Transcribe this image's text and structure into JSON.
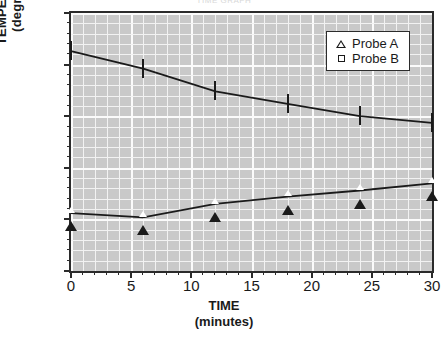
{
  "title_sliver": "TIME GRAPH",
  "axes": {
    "x": {
      "label_main": "TIME",
      "label_sub": "(minutes)",
      "ticks": [
        0,
        5,
        10,
        15,
        20,
        25,
        30
      ],
      "min": 0,
      "max": 30,
      "minor_step": 1
    },
    "y": {
      "label_main": "TEMPERATURE",
      "label_sub": "(degrees C)",
      "ticks": [
        20,
        30,
        40,
        50,
        60,
        70
      ],
      "min": 20,
      "max": 70,
      "minor_step": 2
    }
  },
  "legend": {
    "position": "top-right-inside",
    "entries": [
      {
        "label": "Probe A",
        "marker": "triangle-open"
      },
      {
        "label": "Probe B",
        "marker": "square-open"
      }
    ]
  },
  "colors": {
    "plot_background": "#c9c9c9",
    "gridline": "#f2f2f2",
    "axis": "#2b2b2b",
    "line": "#1a1a1a",
    "marker_fill": "#ffffff",
    "page_background": "#ffffff",
    "text": "#1a1a1a"
  },
  "chart_data": {
    "type": "line",
    "title": "",
    "xlabel": "TIME (minutes)",
    "ylabel": "TEMPERATURE (degrees C)",
    "xlim": [
      0,
      30
    ],
    "ylim": [
      20,
      70
    ],
    "grid": true,
    "legend_position": "upper right",
    "x": [
      0,
      6,
      12,
      18,
      24,
      30
    ],
    "series": [
      {
        "name": "Probe A",
        "marker": "triangle-open",
        "values": [
          31.2,
          30.4,
          33.0,
          34.4,
          35.6,
          37.0
        ]
      },
      {
        "name": "Probe B",
        "marker": "square-open",
        "values": [
          62.6,
          59.2,
          54.8,
          52.4,
          50.0,
          48.7
        ]
      }
    ]
  }
}
